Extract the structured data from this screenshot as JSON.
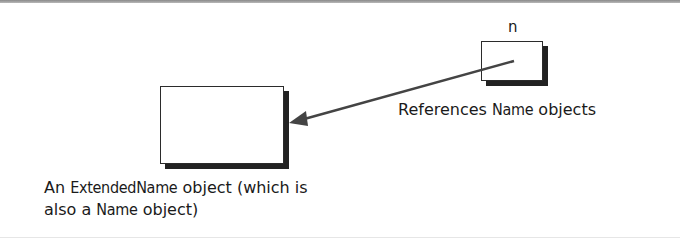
{
  "diagram": {
    "variable": {
      "name": "n"
    },
    "reference_caption": {
      "prefix": "References ",
      "code": "Name",
      "suffix": " objects"
    },
    "object_caption": {
      "line1_prefix": "An ",
      "line1_code": "ExtendedName",
      "line1_suffix": " object (which is",
      "line2_prefix": "also a ",
      "line2_code": "Name",
      "line2_suffix": " object)"
    },
    "colors": {
      "box_border": "#2b2b2b",
      "shadow": "#222222",
      "arrow": "#444444",
      "text": "#1a1a1a"
    }
  }
}
